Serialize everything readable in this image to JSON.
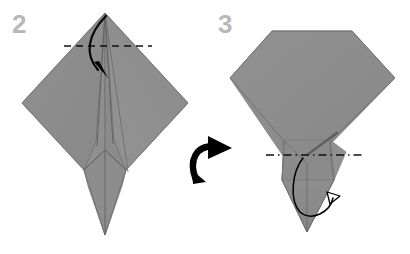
{
  "document": {
    "type": "origami-instruction-diagram",
    "title": "Origami folding steps 2 and 3",
    "background_color": "#ffffff"
  },
  "palette": {
    "paper_fill": "#8c8c8c",
    "paper_fill_light": "#949494",
    "paper_fill_dark": "#848484",
    "crease_line": "#6a6a6a",
    "fold_line": "#111111",
    "arrow_color": "#000000",
    "step_number_color": "#b9b9b9"
  },
  "steps": [
    {
      "id": "step-2",
      "number": "2",
      "number_position": {
        "x": 12,
        "y": 33
      },
      "shape_name": "kite-base-with-narrow-point",
      "description": "Diamond shaped folded paper with long narrow point extending downward",
      "fold_line": {
        "name": "valley-fold-dashed-line",
        "style": "dashed",
        "x1": 64,
        "y1": 46,
        "x2": 152,
        "y2": 46
      },
      "action_arrow": {
        "name": "fold-down-arrow",
        "style": "solid-curved",
        "direction": "down",
        "from": {
          "x": 106,
          "y": 16
        },
        "to": {
          "x": 104,
          "y": 78
        }
      },
      "outline_points": "105,13 22,103 84,170 105,235 126,170 188,103",
      "bounds": {
        "x": 22,
        "y": 13,
        "width": 166,
        "height": 222
      }
    },
    {
      "id": "step-3",
      "number": "3",
      "number_position": {
        "x": 218,
        "y": 33
      },
      "shape_name": "flat-topped-diamond-with-point",
      "description": "Diamond with top corner folded down flat, narrow point extending downward",
      "fold_line": {
        "name": "reverse-fold-dash-dot-line",
        "style": "dash-dot",
        "x1": 266,
        "y1": 155,
        "x2": 362,
        "y2": 155
      },
      "action_arrow": {
        "name": "inside-reverse-fold-loop-arrow",
        "style": "thin-loop-hollow-head",
        "direction": "loop-up-right"
      },
      "outline_points": "272,31 352,31 395,78 312,163 307,232 288,163 230,78",
      "bounds": {
        "x": 230,
        "y": 31,
        "width": 165,
        "height": 201
      }
    }
  ],
  "transition_arrow": {
    "name": "turn-over-arrow",
    "description": "Thick curved arrow pointing right, indicating proceed to next step",
    "position": {
      "x": 192,
      "y": 143
    },
    "width": 42,
    "height": 40,
    "color": "#000000"
  }
}
